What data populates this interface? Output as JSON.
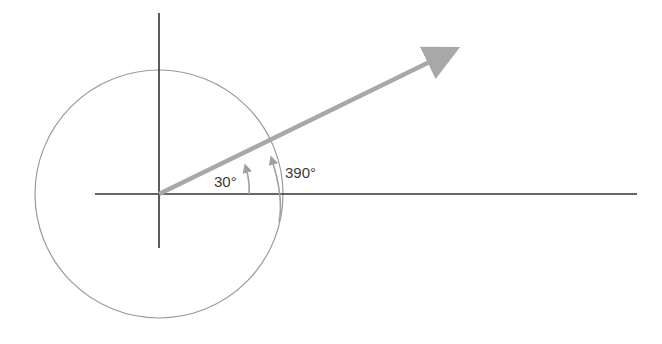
{
  "diagram": {
    "labels": {
      "angle1": "30°",
      "angle2": "390°"
    },
    "colors": {
      "axes": "#333333",
      "circle": "#9a9a9a",
      "vector": "#a8a8a8",
      "angle_arc": "#a0a0a0",
      "text": "#3a3a3a"
    }
  }
}
